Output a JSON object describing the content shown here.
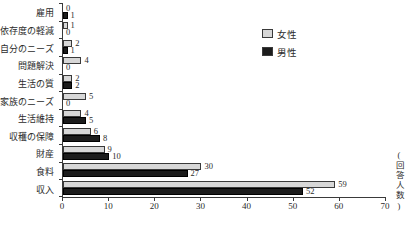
{
  "chart_data": {
    "type": "bar",
    "orientation": "horizontal",
    "title": "",
    "xlabel": "(回答人数)",
    "ylabel": "",
    "xlim": [
      0,
      70
    ],
    "xticks": [
      0,
      10,
      20,
      30,
      40,
      50,
      60,
      70
    ],
    "grid": false,
    "legend_position": "upper-right",
    "categories": [
      "雇用",
      "依存度の軽減",
      "自分のニーズ",
      "問題解決",
      "生活の質",
      "家族のニーズ",
      "生活維持",
      "収穫の保障",
      "財産",
      "食料",
      "収入"
    ],
    "series": [
      {
        "name": "女性",
        "color": "#d7d7d7",
        "values": [
          0,
          1,
          2,
          4,
          2,
          5,
          4,
          6,
          9,
          30,
          59
        ]
      },
      {
        "name": "男性",
        "color": "#1c1c1c",
        "values": [
          1,
          0,
          1,
          0,
          2,
          0,
          5,
          8,
          10,
          27,
          52
        ]
      }
    ],
    "value_labels_shown": true
  }
}
